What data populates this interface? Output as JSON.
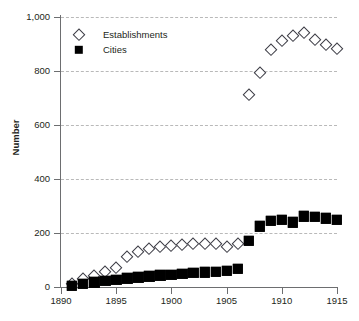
{
  "chart_data": {
    "type": "scatter",
    "title": "",
    "xlabel": "",
    "ylabel": "Number",
    "xlim": [
      1890,
      1915
    ],
    "ylim": [
      0,
      1000
    ],
    "xticks": [
      1890,
      1895,
      1900,
      1905,
      1910,
      1915
    ],
    "xtick_labels": [
      "1890",
      "1895",
      "1900",
      "1905",
      "1910",
      "1915"
    ],
    "yticks": [
      0,
      200,
      400,
      600,
      800,
      1000
    ],
    "ytick_labels": [
      "0",
      "200",
      "400",
      "600",
      "800",
      "1,000"
    ],
    "grid": "horizontal-dashed",
    "legend_position": "top-left-inside",
    "series": [
      {
        "name": "Establishments",
        "marker": "open-diamond",
        "color": "#3b3b44",
        "points": [
          {
            "x": 1891,
            "y": 10
          },
          {
            "x": 1892,
            "y": 28
          },
          {
            "x": 1893,
            "y": 42
          },
          {
            "x": 1894,
            "y": 55
          },
          {
            "x": 1895,
            "y": 72
          },
          {
            "x": 1896,
            "y": 112
          },
          {
            "x": 1897,
            "y": 130
          },
          {
            "x": 1898,
            "y": 140
          },
          {
            "x": 1899,
            "y": 148
          },
          {
            "x": 1900,
            "y": 152
          },
          {
            "x": 1901,
            "y": 156
          },
          {
            "x": 1902,
            "y": 158
          },
          {
            "x": 1903,
            "y": 160
          },
          {
            "x": 1904,
            "y": 158
          },
          {
            "x": 1905,
            "y": 150
          },
          {
            "x": 1906,
            "y": 160
          },
          {
            "x": 1907,
            "y": 710
          },
          {
            "x": 1908,
            "y": 793
          },
          {
            "x": 1909,
            "y": 878
          },
          {
            "x": 1910,
            "y": 910
          },
          {
            "x": 1911,
            "y": 930
          },
          {
            "x": 1912,
            "y": 940
          },
          {
            "x": 1913,
            "y": 915
          },
          {
            "x": 1914,
            "y": 898
          },
          {
            "x": 1915,
            "y": 880
          }
        ]
      },
      {
        "name": "Cities",
        "marker": "filled-square",
        "color": "#000000",
        "points": [
          {
            "x": 1891,
            "y": 5
          },
          {
            "x": 1892,
            "y": 12
          },
          {
            "x": 1893,
            "y": 18
          },
          {
            "x": 1894,
            "y": 22
          },
          {
            "x": 1895,
            "y": 26
          },
          {
            "x": 1896,
            "y": 32
          },
          {
            "x": 1897,
            "y": 36
          },
          {
            "x": 1898,
            "y": 40
          },
          {
            "x": 1899,
            "y": 43
          },
          {
            "x": 1900,
            "y": 46
          },
          {
            "x": 1901,
            "y": 50
          },
          {
            "x": 1902,
            "y": 52
          },
          {
            "x": 1903,
            "y": 55
          },
          {
            "x": 1904,
            "y": 57
          },
          {
            "x": 1905,
            "y": 60
          },
          {
            "x": 1906,
            "y": 68
          },
          {
            "x": 1907,
            "y": 170
          },
          {
            "x": 1908,
            "y": 225
          },
          {
            "x": 1909,
            "y": 245
          },
          {
            "x": 1910,
            "y": 248
          },
          {
            "x": 1911,
            "y": 240
          },
          {
            "x": 1912,
            "y": 262
          },
          {
            "x": 1913,
            "y": 260
          },
          {
            "x": 1914,
            "y": 255
          },
          {
            "x": 1915,
            "y": 250
          },
          {
            "x": 1916,
            "y": 252
          }
        ]
      }
    ]
  }
}
